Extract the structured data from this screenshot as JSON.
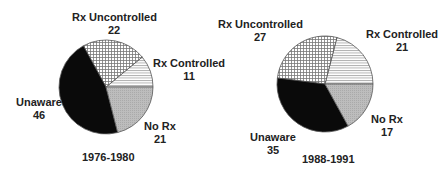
{
  "chart_data": [
    {
      "type": "pie",
      "title": "1976-1980",
      "categories": [
        "Rx Uncontrolled",
        "Rx Controlled",
        "No Rx",
        "Unaware"
      ],
      "values": [
        22,
        11,
        21,
        46
      ],
      "fills": [
        "crosshatch-light",
        "horizontal-lines",
        "gray",
        "black"
      ]
    },
    {
      "type": "pie",
      "title": "1988-1991",
      "categories": [
        "Rx Uncontrolled",
        "Rx Controlled",
        "No Rx",
        "Unaware"
      ],
      "values": [
        27,
        21,
        17,
        35
      ],
      "fills": [
        "crosshatch-light",
        "horizontal-lines",
        "gray",
        "black"
      ]
    }
  ],
  "left": {
    "year": "1976-1980",
    "labels": {
      "uncontrolled": {
        "name": "Rx Uncontrolled",
        "value": "22"
      },
      "controlled": {
        "name": "Rx Controlled",
        "value": "11"
      },
      "norx": {
        "name": "No Rx",
        "value": "21"
      },
      "unaware": {
        "name": "Unaware",
        "value": "46"
      }
    }
  },
  "right": {
    "year": "1988-1991",
    "labels": {
      "uncontrolled": {
        "name": "Rx Uncontrolled",
        "value": "27"
      },
      "controlled": {
        "name": "Rx Controlled",
        "value": "21"
      },
      "norx": {
        "name": "No Rx",
        "value": "17"
      },
      "unaware": {
        "name": "Unaware",
        "value": "35"
      }
    }
  },
  "colors": {
    "black": "#0a0a0a",
    "gray": "#b8b8b8",
    "line": "#555555"
  }
}
